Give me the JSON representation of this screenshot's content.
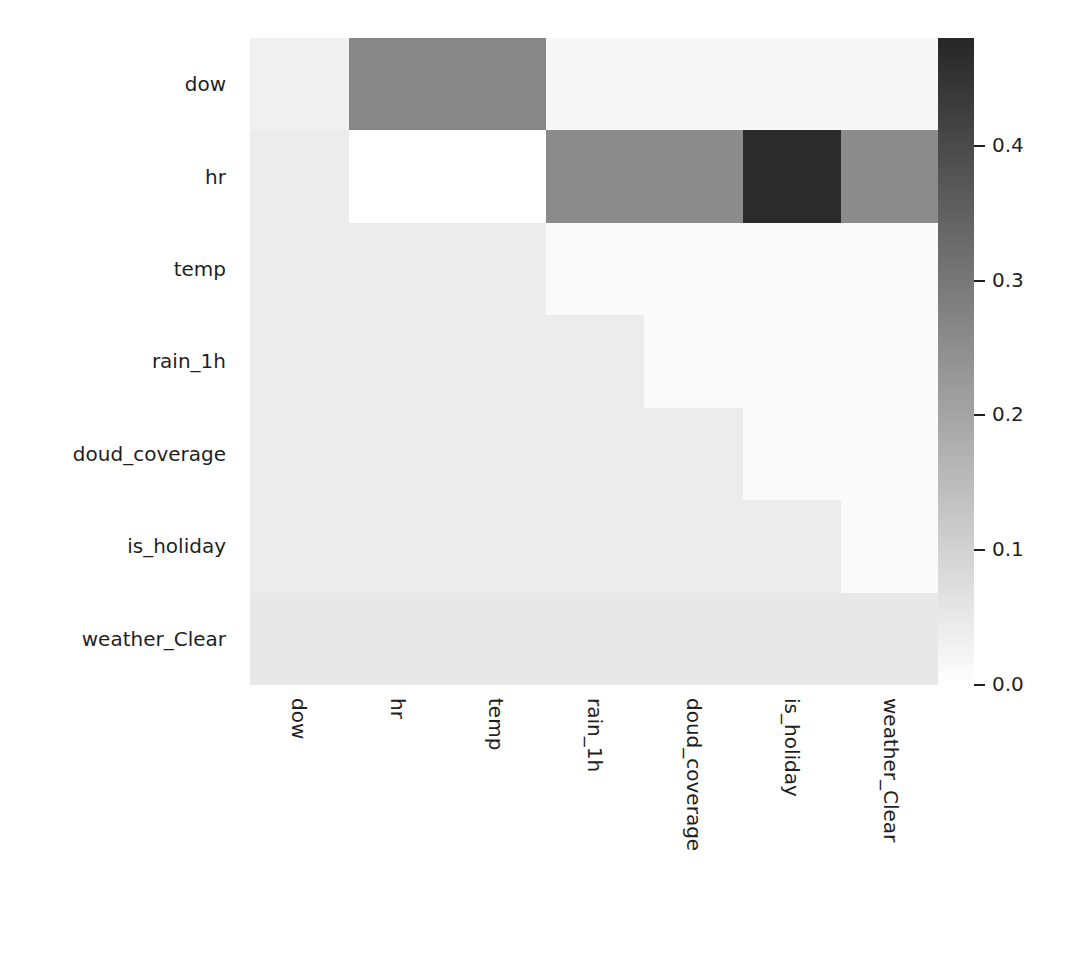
{
  "figure": {
    "kind": "correlation-heatmap",
    "background": "#ffffff"
  },
  "chart_data": {
    "type": "heatmap",
    "title": "",
    "xlabel": "",
    "ylabel": "",
    "grid": false,
    "legend_position": "right",
    "colormap": "Greys",
    "vmin": 0.0,
    "vmax": 0.48,
    "x_categories": [
      "dow",
      "hr",
      "temp",
      "rain_1h",
      "cloud_coverage",
      "is_holiday",
      "weather_Clear"
    ],
    "y_categories": [
      "dow",
      "hr",
      "temp",
      "rain_1h",
      "cloud_coverage",
      "is_holiday",
      "weather_Clear"
    ],
    "x_tick_labels": [
      "dow",
      "hr",
      "temp",
      "rain_1h",
      "doud_coverage",
      "is_holiday",
      "weather_Clear"
    ],
    "y_tick_labels": [
      "dow",
      "hr",
      "temp",
      "rain_1h",
      "doud_coverage",
      "is_holiday",
      "weather_Clear"
    ],
    "colorbar": {
      "ticks": [
        0.0,
        0.1,
        0.2,
        0.3,
        0.4
      ],
      "tick_labels": [
        "0.0",
        "0.1",
        "0.2",
        "0.3",
        "0.4"
      ],
      "min_color": "#ffffff",
      "max_color": "#262626"
    },
    "values": [
      [
        0.02,
        0.27,
        0.27,
        0.012,
        0.012,
        0.012,
        0.012
      ],
      [
        0.026,
        0.0,
        0.0,
        0.262,
        0.262,
        0.47,
        0.262
      ],
      [
        0.026,
        0.026,
        0.026,
        0.012,
        0.012,
        0.012,
        0.012
      ],
      [
        0.026,
        0.026,
        0.026,
        0.026,
        0.012,
        0.012,
        0.012
      ],
      [
        0.026,
        0.026,
        0.026,
        0.026,
        0.026,
        0.012,
        0.012
      ],
      [
        0.026,
        0.026,
        0.026,
        0.026,
        0.026,
        0.026,
        0.012
      ],
      [
        0.032,
        0.032,
        0.032,
        0.032,
        0.032,
        0.032,
        0.032
      ]
    ],
    "cell_colors": [
      [
        "#f0f0f0",
        "#878787",
        "#878787",
        "#f7f7f7",
        "#f7f7f7",
        "#f7f7f7",
        "#f7f7f7"
      ],
      [
        "#ececec",
        "#ffffff",
        "#ffffff",
        "#8b8b8b",
        "#8b8b8b",
        "#2b2b2b",
        "#8b8b8b"
      ],
      [
        "#ececec",
        "#ececec",
        "#ececec",
        "#fafafa",
        "#fafafa",
        "#fafafa",
        "#fafafa"
      ],
      [
        "#ececec",
        "#ececec",
        "#ececec",
        "#ececec",
        "#fafafa",
        "#fafafa",
        "#fafafa"
      ],
      [
        "#ececec",
        "#ececec",
        "#ececec",
        "#ececec",
        "#ececec",
        "#fafafa",
        "#fafafa"
      ],
      [
        "#ececec",
        "#ececec",
        "#ececec",
        "#ececec",
        "#ececec",
        "#ececec",
        "#fafafa"
      ],
      [
        "#e8e8e8",
        "#e8e8e8",
        "#e8e8e8",
        "#e8e8e8",
        "#e8e8e8",
        "#e8e8e8",
        "#e8e8e8"
      ]
    ]
  }
}
